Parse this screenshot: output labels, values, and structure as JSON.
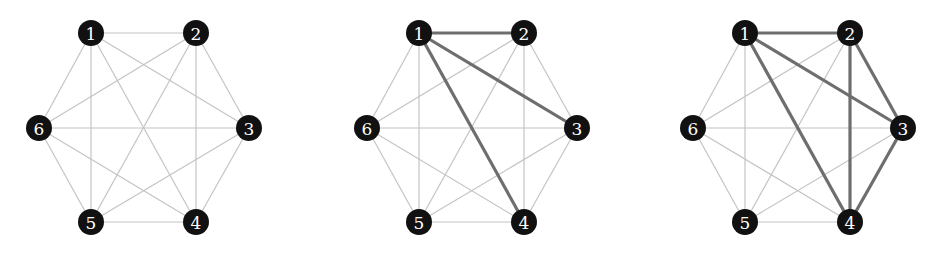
{
  "diagram": {
    "type": "complete-graph-sequence",
    "nodes": [
      "1",
      "2",
      "3",
      "4",
      "5",
      "6"
    ],
    "edges": [
      [
        "1",
        "2"
      ],
      [
        "1",
        "3"
      ],
      [
        "1",
        "4"
      ],
      [
        "1",
        "5"
      ],
      [
        "1",
        "6"
      ],
      [
        "2",
        "3"
      ],
      [
        "2",
        "4"
      ],
      [
        "2",
        "5"
      ],
      [
        "2",
        "6"
      ],
      [
        "3",
        "4"
      ],
      [
        "3",
        "5"
      ],
      [
        "3",
        "6"
      ],
      [
        "4",
        "5"
      ],
      [
        "4",
        "6"
      ],
      [
        "5",
        "6"
      ]
    ],
    "panels": [
      {
        "name": "panel-1",
        "highlighted_edges": []
      },
      {
        "name": "panel-2",
        "highlighted_edges": [
          [
            "1",
            "2"
          ],
          [
            "1",
            "3"
          ],
          [
            "1",
            "4"
          ]
        ]
      },
      {
        "name": "panel-3",
        "highlighted_edges": [
          [
            "1",
            "2"
          ],
          [
            "1",
            "3"
          ],
          [
            "1",
            "4"
          ],
          [
            "2",
            "3"
          ],
          [
            "2",
            "4"
          ],
          [
            "3",
            "4"
          ]
        ]
      }
    ],
    "colors": {
      "node_fill": "#111111",
      "node_label": "#ffffff",
      "edge": "#c4c4c4",
      "highlight_edge": "#6e6e6e"
    }
  }
}
